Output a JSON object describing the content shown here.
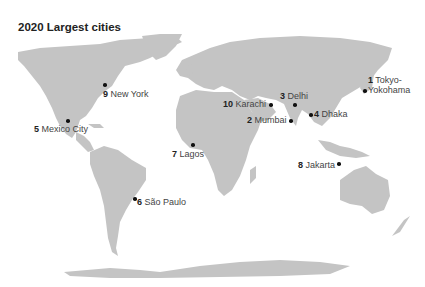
{
  "title": "2020 Largest cities",
  "colors": {
    "land": "#c4c4c4",
    "ocean": "#ffffff",
    "marker": "#111111",
    "text": "#444444"
  },
  "cities": [
    {
      "rank": "1",
      "name": "Tokyo-",
      "name2": "Yokohama"
    },
    {
      "rank": "2",
      "name": "Mumbai"
    },
    {
      "rank": "3",
      "name": "Delhi"
    },
    {
      "rank": "4",
      "name": "Dhaka"
    },
    {
      "rank": "5",
      "name": "Mexico City"
    },
    {
      "rank": "6",
      "name": "São Paulo"
    },
    {
      "rank": "7",
      "name": "Lagos"
    },
    {
      "rank": "8",
      "name": "Jakarta"
    },
    {
      "rank": "9",
      "name": "New York"
    },
    {
      "rank": "10",
      "name": "Karachi"
    }
  ]
}
